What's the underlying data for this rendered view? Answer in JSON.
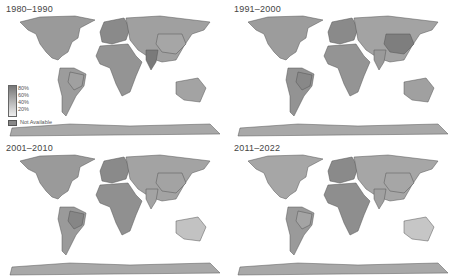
{
  "panels": [
    {
      "title": "1980–1990",
      "shades": {
        "na": "#9a9a9a",
        "sa": "#9c9c9c",
        "eu": "#8a8a8a",
        "af": "#949494",
        "asia": "#a0a0a0",
        "china": "#a6a6a6",
        "india": "#7a7a7a",
        "aus": "#a3a3a3",
        "ant": "#a8a8a8",
        "brazil": "#a0a0a0"
      }
    },
    {
      "title": "1991–2000",
      "shades": {
        "na": "#9c9c9c",
        "sa": "#939393",
        "eu": "#8a8a8a",
        "af": "#949494",
        "asia": "#a3a3a3",
        "china": "#7e7e7e",
        "india": "#9a9a9a",
        "aus": "#a0a0a0",
        "ant": "#a8a8a8",
        "brazil": "#888888"
      }
    },
    {
      "title": "2001–2010",
      "shades": {
        "na": "#9a9a9a",
        "sa": "#9a9a9a",
        "eu": "#8a8a8a",
        "af": "#909090",
        "asia": "#a3a3a3",
        "china": "#a3a3a3",
        "india": "#a3a3a3",
        "aus": "#c2c2c2",
        "ant": "#a8a8a8",
        "brazil": "#868686"
      }
    },
    {
      "title": "2011–2022",
      "shades": {
        "na": "#a6a6a6",
        "sa": "#9a9a9a",
        "eu": "#8a8a8a",
        "af": "#8e8e8e",
        "asia": "#a6a6a6",
        "china": "#a6a6a6",
        "india": "#a0a0a0",
        "aus": "#c6c6c6",
        "ant": "#a8a8a8",
        "brazil": "#a4a4a4"
      }
    }
  ],
  "legend": {
    "ticks": [
      "80%",
      "60%",
      "40%",
      "20%"
    ],
    "not_available": "Not Available"
  }
}
